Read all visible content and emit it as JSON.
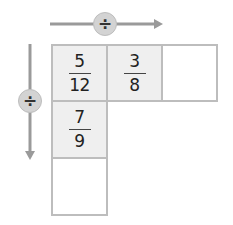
{
  "operators": {
    "horizontal": {
      "symbol": "÷",
      "direction": "right"
    },
    "vertical": {
      "symbol": "÷",
      "direction": "down"
    }
  },
  "grid": {
    "row1": [
      {
        "numerator": "5",
        "denominator": "12",
        "filled": true
      },
      {
        "numerator": "3",
        "denominator": "8",
        "filled": true
      },
      {
        "numerator": "",
        "denominator": "",
        "filled": false,
        "empty": true
      }
    ],
    "col1": [
      {
        "numerator": "7",
        "denominator": "9",
        "filled": true
      },
      {
        "numerator": "",
        "denominator": "",
        "filled": false,
        "empty": true
      }
    ]
  },
  "colors": {
    "arrow": "#999999",
    "circle_fill": "#d3d3d3",
    "cell_border": "#bdbdbd",
    "cell_fill": "#efefef",
    "text": "#222222"
  }
}
